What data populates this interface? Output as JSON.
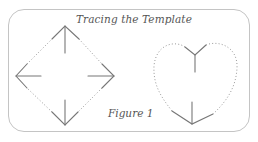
{
  "title": "Tracing the Template",
  "caption": "Figure 1",
  "colors": {
    "frame": "#c4c4c4",
    "solid_stroke": "#777777",
    "dotted_stroke": "#9a9a9a",
    "text": "#555555"
  },
  "shapes": [
    {
      "name": "diamond",
      "style": "dotted outline with four solid arrows pointing to vertices",
      "vertices": {
        "top": [
          65,
          26
        ],
        "right": [
          114,
          76
        ],
        "bottom": [
          65,
          125
        ],
        "left": [
          16,
          76
        ]
      },
      "arrows": [
        "up",
        "right",
        "down",
        "left"
      ]
    },
    {
      "name": "heart",
      "style": "dotted outline with solid Y-shaped guides at top notch and bottom point",
      "top_notch": [
        195,
        55
      ],
      "bottom_point": [
        192,
        124
      ]
    }
  ]
}
